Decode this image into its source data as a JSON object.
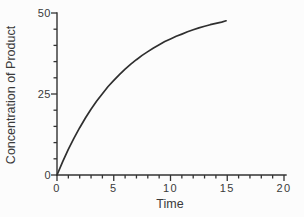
{
  "page": {
    "background": "#fcfcfc"
  },
  "chart_data": {
    "type": "line",
    "title": "",
    "xlabel": "Time",
    "ylabel": "Concentration of Product",
    "xlim": [
      0,
      20
    ],
    "ylim": [
      0,
      50
    ],
    "x_major_ticks": [
      0,
      5,
      10,
      15,
      20
    ],
    "x_tick_labels": [
      "0",
      "5",
      "10",
      "15",
      "20"
    ],
    "x_minor_tick_step": 1,
    "y_major_ticks": [
      0,
      25,
      50
    ],
    "y_tick_labels": [
      "0",
      "25",
      "50"
    ],
    "y_minor_tick_step": 5,
    "grid": false,
    "legend": "none",
    "ink_color": "#333333",
    "curve_color": "#2f2f2f",
    "series": [
      {
        "name": "product-concentration",
        "x": [
          0,
          0.5,
          1,
          1.5,
          2,
          2.5,
          3,
          3.5,
          4,
          4.5,
          5,
          5.5,
          6,
          6.5,
          7,
          7.5,
          8,
          8.5,
          9,
          9.5,
          10,
          10.5,
          11,
          11.5,
          12,
          12.5,
          13,
          13.5,
          14,
          14.5,
          14.9
        ],
        "y": [
          0,
          4.1,
          7.9,
          11.4,
          14.6,
          17.6,
          20.3,
          22.8,
          25.1,
          27.3,
          29.2,
          31.0,
          32.7,
          34.2,
          35.6,
          36.9,
          38.1,
          39.2,
          40.2,
          41.2,
          42.0,
          42.8,
          43.5,
          44.2,
          44.8,
          45.4,
          45.9,
          46.4,
          46.8,
          47.2,
          47.6
        ]
      }
    ]
  }
}
